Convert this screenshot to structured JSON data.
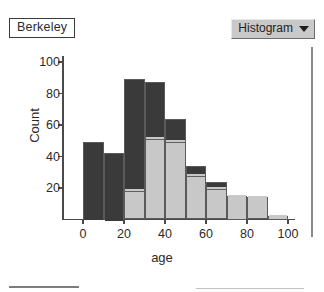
{
  "window": {
    "dataset_label": "Berkeley",
    "plot_type_selector": {
      "value": "Histogram",
      "caret_icon": "chevron-down-icon"
    }
  },
  "chart_data": {
    "type": "bar",
    "title": "",
    "xlabel": "age",
    "ylabel": "Count",
    "xlim": [
      -5,
      105
    ],
    "ylim": [
      0,
      105
    ],
    "xticks": [
      0,
      20,
      40,
      60,
      80,
      100
    ],
    "yticks": [
      20,
      40,
      60,
      80,
      100
    ],
    "xtick_labels": [
      "0",
      "20",
      "40",
      "60",
      "80",
      "100"
    ],
    "ytick_labels": [
      "20",
      "40",
      "60",
      "80",
      "100"
    ],
    "grid": false,
    "legend": "none",
    "bin_width": 10,
    "bin_starts": [
      0,
      10,
      20,
      30,
      40,
      50,
      60,
      70,
      80,
      90
    ],
    "categories": [
      "0-10",
      "10-20",
      "20-30",
      "30-40",
      "40-50",
      "50-60",
      "60-70",
      "70-80",
      "80-90",
      "90-100"
    ],
    "stacked": true,
    "series": [
      {
        "name": "lower-segment",
        "color": "#c8c8c8",
        "values": [
          0,
          0,
          19,
          52,
          50,
          28,
          20,
          15,
          14,
          2.5
        ]
      },
      {
        "name": "upper-segment",
        "color": "#3a3a3a",
        "values": [
          49,
          42.5,
          70,
          35,
          14,
          6,
          4,
          0,
          0,
          0
        ]
      }
    ],
    "totals": [
      49,
      42.5,
      89,
      87,
      64,
      34,
      24,
      15,
      14,
      2.5
    ]
  },
  "colors": {
    "bar_dark": "#3a3a3a",
    "bar_light": "#c8c8c8",
    "axis": "#4a4a4a",
    "dropdown_face": "#c9c9c9",
    "background": "#ffffff"
  }
}
